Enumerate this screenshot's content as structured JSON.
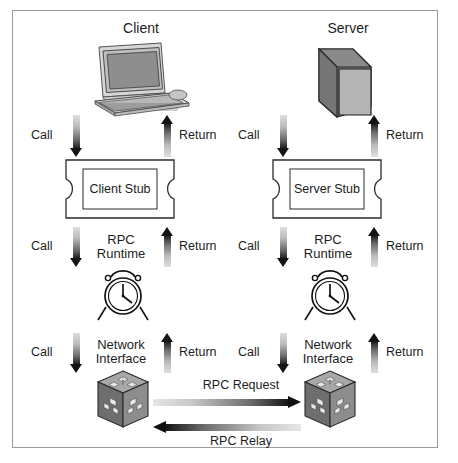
{
  "diagram": {
    "frame_border_color": "#9a9a9a",
    "background": "#ffffff",
    "arrow_dark": "#141414",
    "arrow_light": "#dedede"
  },
  "columns": [
    {
      "id": "client",
      "title": "Client",
      "endpoint_icon": "computer-workstation-icon",
      "stub_label": "Client Stub",
      "runtime_label": "RPC\nRuntime",
      "runtime_label_line1": "RPC",
      "runtime_label_line2": "Runtime",
      "runtime_icon": "alarm-clock-icon",
      "network_label_line1": "Network",
      "network_label_line2": "Interface",
      "network_icon": "network-cube-icon",
      "flow_labels": {
        "call": "Call",
        "return": "Return"
      }
    },
    {
      "id": "server",
      "title": "Server",
      "endpoint_icon": "server-tower-icon",
      "stub_label": "Server Stub",
      "runtime_label": "RPC\nRuntime",
      "runtime_label_line1": "RPC",
      "runtime_label_line2": "Runtime",
      "runtime_icon": "alarm-clock-icon",
      "network_label_line1": "Network",
      "network_label_line2": "Interface",
      "network_icon": "network-cube-icon",
      "flow_labels": {
        "call": "Call",
        "return": "Return"
      }
    }
  ],
  "transport": {
    "request_label": "RPC Request",
    "relay_label": "RPC Relay"
  },
  "colors": {
    "server_dark_face": "#808080",
    "server_light_face": "#b5b5b5",
    "cube_top": "#a8a8a8",
    "cube_left": "#6e6e6e",
    "cube_right": "#8d8d8d",
    "monitor_screen": "#8e8e8e",
    "monitor_body": "#c9c9c9"
  }
}
